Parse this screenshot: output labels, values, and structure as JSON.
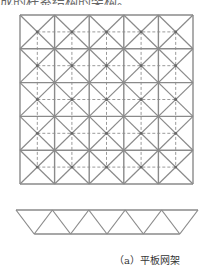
{
  "header": {
    "clipped_text": "  成的杆系结构的架构。"
  },
  "diagram": {
    "plan_view": {
      "x0": 20,
      "y0": 15,
      "x1": 193,
      "y1": 184,
      "cols": 5,
      "rows": 5,
      "line_color": "#8a8a8a",
      "dash_color": "#9a9a9a"
    },
    "elevation_view": {
      "top_y": 210,
      "bottom_y": 234,
      "top_x0": 16,
      "top_x1": 198,
      "bays": 5,
      "line_color": "#8a8a8a"
    }
  },
  "caption": {
    "label": "（a）平板网架"
  }
}
